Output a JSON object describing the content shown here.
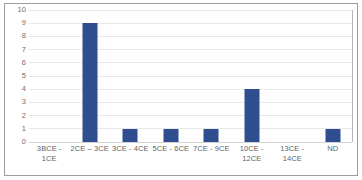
{
  "chart_data": {
    "type": "bar",
    "title": "",
    "subtitle": "",
    "xlabel": "",
    "ylabel": "",
    "categories": [
      "3BCE - 1CE",
      "2CE – 3CE",
      "3CE - 4CE",
      "5CE - 6CE",
      "7CE - 9CE",
      "10CE - 12CE",
      "13CE - 14CE",
      "ND"
    ],
    "category_lines": [
      [
        "3BCE - 1CE"
      ],
      [
        "2CE – 3CE"
      ],
      [
        "3CE - 4CE"
      ],
      [
        "5CE - 6CE"
      ],
      [
        "7CE - 9CE"
      ],
      [
        "10CE -",
        "12CE"
      ],
      [
        "13CE -",
        "14CE"
      ],
      [
        "ND"
      ]
    ],
    "values": [
      0,
      9,
      1,
      1,
      1,
      4,
      0,
      1
    ],
    "ylim": [
      0,
      10
    ],
    "ytick_values": [
      10,
      9,
      8,
      7,
      6,
      5,
      4,
      3,
      2,
      1,
      0
    ],
    "ytick_labels": [
      "10",
      "9",
      "8",
      "7",
      "6",
      "5",
      "4",
      "3",
      "2",
      "1",
      "0"
    ],
    "ystep": 1,
    "grid": true,
    "grid_axis": "y",
    "legend": false,
    "legend_position": "none",
    "series": [
      {
        "name": "",
        "values": [
          0,
          9,
          1,
          1,
          1,
          4,
          0,
          1
        ]
      }
    ]
  },
  "style": {
    "bar_color": "#2F4E8F",
    "gridline_color": "#e8e8e8",
    "axis_color": "#b5b5b5",
    "tick_label_color": "#6f6f6f",
    "category_label_color": "#5f5f5f",
    "plot_background": "#ffffff",
    "figure_background": "#ffffff",
    "figure_border_color": "#9c9c9c"
  }
}
